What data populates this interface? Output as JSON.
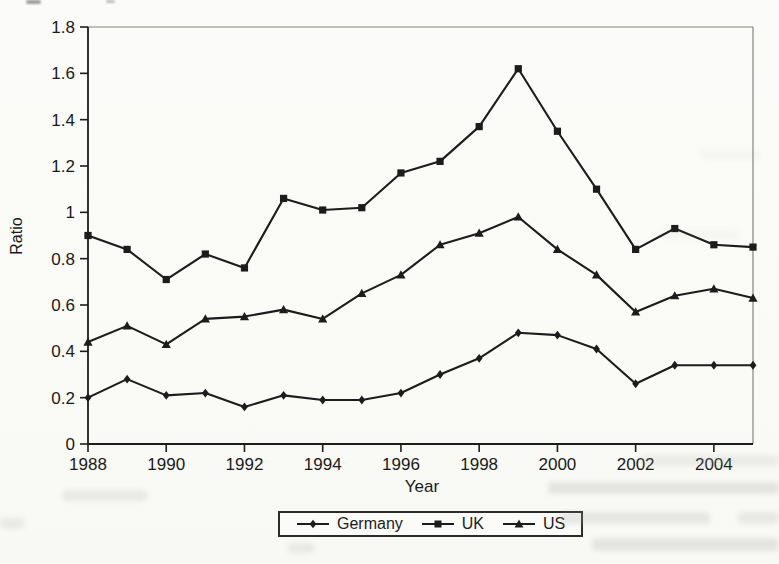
{
  "figure": {
    "kind": "scanned line chart"
  },
  "chart_data": {
    "type": "line",
    "title": "",
    "xlabel": "Year",
    "ylabel": "Ratio",
    "xlim": [
      1988,
      2005
    ],
    "ylim": [
      0,
      1.8
    ],
    "grid": false,
    "legend_position": "bottom-center-boxed",
    "x_tick_labels": [
      "1988",
      "1990",
      "1992",
      "1994",
      "1996",
      "1998",
      "2000",
      "2002",
      "2004"
    ],
    "y_tick_labels": [
      "0",
      "0.2",
      "0.4",
      "0.6",
      "0.8",
      "1",
      "1.2",
      "1.4",
      "1.6",
      "1.8"
    ],
    "x": [
      1988,
      1989,
      1990,
      1991,
      1992,
      1993,
      1994,
      1995,
      1996,
      1997,
      1998,
      1999,
      2000,
      2001,
      2002,
      2003,
      2004,
      2005
    ],
    "series": [
      {
        "name": "Germany",
        "marker": "diamond",
        "color": "#1c1c1c",
        "values": [
          0.2,
          0.28,
          0.21,
          0.22,
          0.16,
          0.21,
          0.19,
          0.19,
          0.22,
          0.3,
          0.37,
          0.48,
          0.47,
          0.41,
          0.26,
          0.34,
          0.34,
          0.34
        ]
      },
      {
        "name": "UK",
        "marker": "square",
        "color": "#1c1c1c",
        "values": [
          0.9,
          0.84,
          0.71,
          0.82,
          0.76,
          1.06,
          1.01,
          1.02,
          1.17,
          1.22,
          1.37,
          1.62,
          1.35,
          1.1,
          0.84,
          0.93,
          0.86,
          0.85
        ]
      },
      {
        "name": "US",
        "marker": "triangle",
        "color": "#1c1c1c",
        "values": [
          0.44,
          0.51,
          0.43,
          0.54,
          0.55,
          0.58,
          0.54,
          0.65,
          0.73,
          0.86,
          0.91,
          0.98,
          0.84,
          0.73,
          0.57,
          0.64,
          0.67,
          0.63
        ]
      }
    ]
  }
}
